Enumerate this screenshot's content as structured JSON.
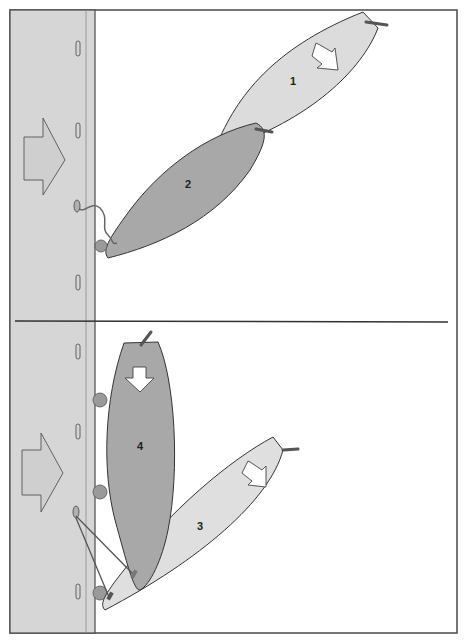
{
  "diagram": {
    "colors": {
      "frame": "#4a4a4a",
      "dock": "#d6d6d6",
      "boat_light": "#dcdcdc",
      "boat_dark": "#a8a8a8",
      "fender": "#9a9a9a",
      "wind_arrow_fill": "#cfcfcf",
      "motion_arrow_fill": "#ffffff"
    },
    "panels": [
      {
        "id": "top",
        "wind_direction": "toward-dock",
        "boats": [
          {
            "label": "1",
            "shade": "light",
            "motion_arrow": "down-left"
          },
          {
            "label": "2",
            "shade": "dark",
            "motion_arrow": null
          }
        ],
        "lines": [
          "bow-line-to-cleat"
        ]
      },
      {
        "id": "bottom",
        "wind_direction": "toward-dock",
        "boats": [
          {
            "label": "4",
            "shade": "dark",
            "motion_arrow": "down"
          },
          {
            "label": "3",
            "shade": "light",
            "motion_arrow": "down-left"
          }
        ],
        "lines": [
          "spring-line-1",
          "spring-line-2"
        ]
      }
    ]
  }
}
